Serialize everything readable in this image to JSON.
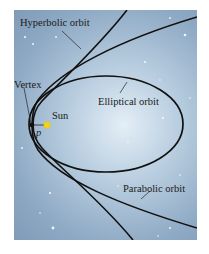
{
  "figure": {
    "labels": {
      "hyperbolic": "Hyperbolic orbit",
      "elliptical": "Elliptical orbit",
      "parabolic": "Parabolic orbit",
      "vertex": "Vertex",
      "sun": "Sun",
      "p": "p"
    },
    "colors": {
      "background_center": "#e4eef6",
      "background_edge": "#7f9bb8",
      "curve": "#111111",
      "sun": "#f2d21a"
    }
  }
}
